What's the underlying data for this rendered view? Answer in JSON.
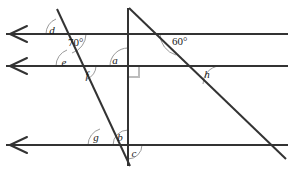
{
  "figure": {
    "background_color": "#ffffff",
    "line_color": "#333333",
    "arc_color": "#9a9a9a",
    "right_angle_color": "#bdbdbd",
    "text_color": "#1a1a1a",
    "width": 291,
    "height": 171
  },
  "parallel_lines": [
    {
      "name": "top-parallel-line",
      "y": 34,
      "x1": 6,
      "x2": 288,
      "arrow": "left"
    },
    {
      "name": "middle-parallel-line",
      "y": 66,
      "x1": 6,
      "x2": 288,
      "arrow": "left"
    },
    {
      "name": "bottom-parallel-line",
      "y": 145,
      "x1": 6,
      "x2": 288,
      "arrow": "left"
    }
  ],
  "transversals": [
    {
      "name": "left-transversal",
      "x1": 57,
      "y1": 9,
      "x2": 130,
      "y2": 166
    },
    {
      "name": "vertical-transversal",
      "x1": 128,
      "y1": 8,
      "x2": 128,
      "y2": 166
    },
    {
      "name": "right-transversal",
      "x1": 129,
      "y1": 8,
      "x2": 286,
      "y2": 159
    }
  ],
  "angle_labels": [
    {
      "id": "d",
      "text": "d",
      "x": 52,
      "y": 34,
      "kind": "letter"
    },
    {
      "id": "angle70",
      "text": "70°",
      "x": 68,
      "y": 46,
      "kind": "degree"
    },
    {
      "id": "e",
      "text": "e",
      "x": 64,
      "y": 66,
      "kind": "letter"
    },
    {
      "id": "f",
      "text": "f",
      "x": 87,
      "y": 78,
      "kind": "letter"
    },
    {
      "id": "a",
      "text": "a",
      "x": 115,
      "y": 63,
      "kind": "letter"
    },
    {
      "id": "angle60",
      "text": "60°",
      "x": 172,
      "y": 45,
      "kind": "degree"
    },
    {
      "id": "h",
      "text": "h",
      "x": 207,
      "y": 76,
      "kind": "letter"
    },
    {
      "id": "g",
      "text": "g",
      "x": 96,
      "y": 139,
      "kind": "letter"
    },
    {
      "id": "b",
      "text": "b",
      "x": 119,
      "y": 139,
      "kind": "letter"
    },
    {
      "id": "c",
      "text": "c",
      "x": 133,
      "y": 156,
      "kind": "letter"
    }
  ],
  "right_angle_marker": {
    "name": "right-angle-square",
    "x": 128,
    "y": 66,
    "size": 10,
    "placement": "below-right"
  }
}
